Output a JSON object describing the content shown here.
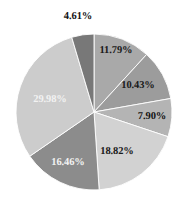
{
  "chart_data": {
    "type": "pie",
    "title": "",
    "subtitle": "",
    "xlabel": "",
    "ylabel": "",
    "grid": false,
    "legend": "none",
    "units": "percent",
    "start_angle_deg": 0,
    "direction": "clockwise",
    "total": 99.99,
    "categories": [
      "11.79%",
      "10.43%",
      "7.90%",
      "18.82%",
      "16.46%",
      "29.98%",
      "4.61%"
    ],
    "values": [
      11.79,
      10.43,
      7.9,
      18.82,
      16.46,
      29.98,
      4.61
    ],
    "colors": [
      "#a9a9a9",
      "#9c9c9c",
      "#b4b4b4",
      "#d2d2d2",
      "#8c8c8c",
      "#cccccc",
      "#787878"
    ],
    "slices": [
      {
        "label": "11.79%",
        "value": 11.79,
        "color": "#a9a9a9",
        "label_x": 116,
        "label_y": 51,
        "label_tone": "on-dark"
      },
      {
        "label": "10.43%",
        "value": 10.43,
        "color": "#9c9c9c",
        "label_x": 138,
        "label_y": 86,
        "label_tone": "on-dark"
      },
      {
        "label": "7.90%",
        "value": 7.9,
        "color": "#b4b4b4",
        "label_x": 152,
        "label_y": 117,
        "label_tone": "outside"
      },
      {
        "label": "18.82%",
        "value": 18.82,
        "color": "#d2d2d2",
        "label_x": 117,
        "label_y": 152,
        "label_tone": "on-dark"
      },
      {
        "label": "16.46%",
        "value": 16.46,
        "color": "#8c8c8c",
        "label_x": 68,
        "label_y": 163,
        "label_tone": "on-light"
      },
      {
        "label": "29.98%",
        "value": 29.98,
        "color": "#cccccc",
        "label_x": 50,
        "label_y": 100,
        "label_tone": "on-light"
      },
      {
        "label": "4.61%",
        "value": 4.61,
        "color": "#787878",
        "label_x": 78,
        "label_y": 17,
        "label_tone": "outside"
      }
    ],
    "geometry": {
      "center_x": 94,
      "center_y": 112,
      "radius": 78
    }
  }
}
